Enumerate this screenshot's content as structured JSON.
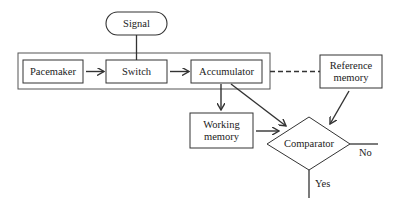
{
  "diagram": {
    "nodes": {
      "signal": "Signal",
      "pacemaker": "Pacemaker",
      "switch": "Switch",
      "accumulator": "Accumulator",
      "reference_memory": [
        "Reference",
        "memory"
      ],
      "working_memory": [
        "Working",
        "memory"
      ],
      "comparator": "Comparator"
    },
    "edge_labels": {
      "no": "No",
      "yes": "Yes"
    },
    "colors": {
      "stroke": "#333333",
      "text": "#222222",
      "background": "#ffffff"
    }
  }
}
